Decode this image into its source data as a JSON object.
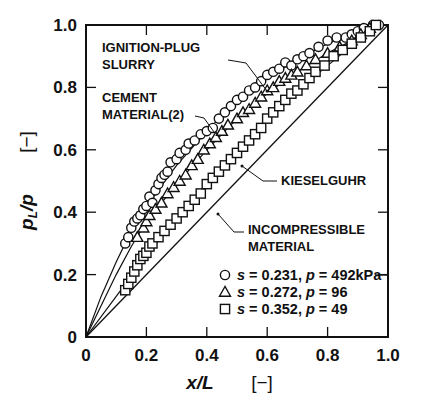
{
  "chart_data": {
    "type": "scatter",
    "title": "",
    "xlabel": "x/L",
    "xlabel_unit": "[−]",
    "ylabel": "pL/p",
    "ylabel_unit": "[−]",
    "xlim": [
      0,
      1.0
    ],
    "ylim": [
      0,
      1.0
    ],
    "grid": false,
    "xticks": [
      "0",
      "0.2",
      "0.4",
      "0.6",
      "0.8",
      "1.0"
    ],
    "yticks": [
      "0",
      "0.2",
      "0.4",
      "0.6",
      "0.8",
      "1.0"
    ],
    "legend_position": "lower right inside",
    "series": [
      {
        "name": "s = 0.231, p = 492kPa",
        "marker": "circle",
        "label": "IGNITION-PLUG SLURRY",
        "points": [
          [
            0.13,
            0.3
          ],
          [
            0.14,
            0.32
          ],
          [
            0.15,
            0.35
          ],
          [
            0.16,
            0.37
          ],
          [
            0.17,
            0.38
          ],
          [
            0.18,
            0.39
          ],
          [
            0.19,
            0.41
          ],
          [
            0.2,
            0.42
          ],
          [
            0.21,
            0.45
          ],
          [
            0.22,
            0.43
          ],
          [
            0.23,
            0.47
          ],
          [
            0.24,
            0.49
          ],
          [
            0.25,
            0.51
          ],
          [
            0.26,
            0.52
          ],
          [
            0.27,
            0.53
          ],
          [
            0.28,
            0.56
          ],
          [
            0.3,
            0.57
          ],
          [
            0.31,
            0.59
          ],
          [
            0.33,
            0.6
          ],
          [
            0.34,
            0.62
          ],
          [
            0.36,
            0.63
          ],
          [
            0.38,
            0.65
          ],
          [
            0.4,
            0.66
          ],
          [
            0.42,
            0.67
          ],
          [
            0.44,
            0.7
          ],
          [
            0.46,
            0.72
          ],
          [
            0.48,
            0.74
          ],
          [
            0.5,
            0.76
          ],
          [
            0.52,
            0.77
          ],
          [
            0.54,
            0.79
          ],
          [
            0.56,
            0.8
          ],
          [
            0.58,
            0.82
          ],
          [
            0.6,
            0.84
          ],
          [
            0.62,
            0.85
          ],
          [
            0.64,
            0.86
          ],
          [
            0.66,
            0.88
          ],
          [
            0.68,
            0.87
          ],
          [
            0.7,
            0.89
          ],
          [
            0.72,
            0.9
          ],
          [
            0.74,
            0.91
          ],
          [
            0.77,
            0.93
          ],
          [
            0.8,
            0.95
          ],
          [
            0.83,
            0.96
          ],
          [
            0.86,
            0.96
          ],
          [
            0.88,
            0.97
          ],
          [
            0.9,
            0.98
          ],
          [
            0.92,
            0.99
          ],
          [
            0.95,
            1.0
          ],
          [
            0.97,
            1.0
          ]
        ]
      },
      {
        "name": "s = 0.272, p = 96",
        "marker": "triangle",
        "label": "CEMENT MATERIAL(2)",
        "points": [
          [
            0.17,
            0.32
          ],
          [
            0.19,
            0.35
          ],
          [
            0.2,
            0.37
          ],
          [
            0.21,
            0.39
          ],
          [
            0.23,
            0.41
          ],
          [
            0.25,
            0.43
          ],
          [
            0.27,
            0.46
          ],
          [
            0.29,
            0.48
          ],
          [
            0.31,
            0.5
          ],
          [
            0.33,
            0.52
          ],
          [
            0.35,
            0.55
          ],
          [
            0.37,
            0.57
          ],
          [
            0.39,
            0.6
          ],
          [
            0.41,
            0.62
          ],
          [
            0.43,
            0.64
          ],
          [
            0.45,
            0.66
          ],
          [
            0.47,
            0.68
          ],
          [
            0.5,
            0.7
          ],
          [
            0.52,
            0.72
          ],
          [
            0.54,
            0.73
          ],
          [
            0.56,
            0.75
          ],
          [
            0.58,
            0.77
          ],
          [
            0.6,
            0.79
          ],
          [
            0.62,
            0.8
          ],
          [
            0.64,
            0.82
          ],
          [
            0.66,
            0.83
          ],
          [
            0.68,
            0.84
          ],
          [
            0.7,
            0.85
          ],
          [
            0.73,
            0.87
          ],
          [
            0.76,
            0.89
          ],
          [
            0.8,
            0.91
          ],
          [
            0.84,
            0.93
          ],
          [
            0.88,
            0.95
          ],
          [
            0.91,
            0.97
          ],
          [
            0.94,
            0.99
          ]
        ]
      },
      {
        "name": "s = 0.352, p = 49",
        "marker": "square",
        "label": "KIESELGUHR",
        "points": [
          [
            0.13,
            0.15
          ],
          [
            0.14,
            0.17
          ],
          [
            0.15,
            0.19
          ],
          [
            0.16,
            0.21
          ],
          [
            0.17,
            0.23
          ],
          [
            0.18,
            0.25
          ],
          [
            0.19,
            0.26
          ],
          [
            0.2,
            0.27
          ],
          [
            0.21,
            0.29
          ],
          [
            0.22,
            0.3
          ],
          [
            0.24,
            0.32
          ],
          [
            0.26,
            0.34
          ],
          [
            0.28,
            0.36
          ],
          [
            0.3,
            0.38
          ],
          [
            0.32,
            0.4
          ],
          [
            0.34,
            0.42
          ],
          [
            0.36,
            0.44
          ],
          [
            0.38,
            0.46
          ],
          [
            0.4,
            0.49
          ],
          [
            0.42,
            0.51
          ],
          [
            0.44,
            0.53
          ],
          [
            0.46,
            0.55
          ],
          [
            0.48,
            0.57
          ],
          [
            0.5,
            0.59
          ],
          [
            0.52,
            0.61
          ],
          [
            0.54,
            0.63
          ],
          [
            0.56,
            0.65
          ],
          [
            0.58,
            0.67
          ],
          [
            0.6,
            0.7
          ],
          [
            0.62,
            0.72
          ],
          [
            0.64,
            0.74
          ],
          [
            0.66,
            0.76
          ],
          [
            0.68,
            0.78
          ],
          [
            0.7,
            0.79
          ],
          [
            0.72,
            0.81
          ],
          [
            0.74,
            0.83
          ],
          [
            0.76,
            0.85
          ],
          [
            0.79,
            0.87
          ],
          [
            0.82,
            0.9
          ],
          [
            0.85,
            0.92
          ],
          [
            0.88,
            0.94
          ],
          [
            0.91,
            0.96
          ],
          [
            0.94,
            0.98
          ],
          [
            0.96,
            1.0
          ]
        ]
      }
    ],
    "reference_line": {
      "name": "INCOMPRESSIBLE MATERIAL",
      "points": [
        [
          0,
          0
        ],
        [
          1,
          1
        ]
      ]
    },
    "fit_curves": [
      {
        "series": 0,
        "points": [
          [
            0,
            0
          ],
          [
            0.05,
            0.13
          ],
          [
            0.1,
            0.24
          ],
          [
            0.15,
            0.34
          ],
          [
            0.2,
            0.42
          ],
          [
            0.3,
            0.55
          ],
          [
            0.4,
            0.66
          ],
          [
            0.5,
            0.76
          ],
          [
            0.6,
            0.83
          ],
          [
            0.7,
            0.89
          ],
          [
            0.8,
            0.94
          ],
          [
            0.9,
            0.98
          ],
          [
            0.97,
            1.0
          ]
        ]
      },
      {
        "series": 1,
        "points": [
          [
            0,
            0
          ],
          [
            0.05,
            0.1
          ],
          [
            0.1,
            0.2
          ],
          [
            0.15,
            0.29
          ],
          [
            0.2,
            0.37
          ],
          [
            0.3,
            0.49
          ],
          [
            0.4,
            0.6
          ],
          [
            0.5,
            0.7
          ],
          [
            0.6,
            0.78
          ],
          [
            0.7,
            0.85
          ],
          [
            0.8,
            0.91
          ],
          [
            0.9,
            0.96
          ],
          [
            0.97,
            1.0
          ]
        ]
      }
    ],
    "annotations": [
      {
        "lines": [
          "IGNITION-PLUG",
          "SLURRY"
        ]
      },
      {
        "lines": [
          "CEMENT",
          "MATERIAL(2)"
        ]
      },
      {
        "lines": [
          "KIESELGUHR"
        ]
      },
      {
        "lines": [
          "INCOMPRESSIBLE",
          "MATERIAL"
        ]
      }
    ],
    "legend": [
      {
        "marker": "circle",
        "text": "s = 0.231, p = 492kPa"
      },
      {
        "marker": "triangle",
        "text": "s = 0.272, p = 96"
      },
      {
        "marker": "square",
        "text": "s = 0.352, p = 49"
      }
    ]
  }
}
